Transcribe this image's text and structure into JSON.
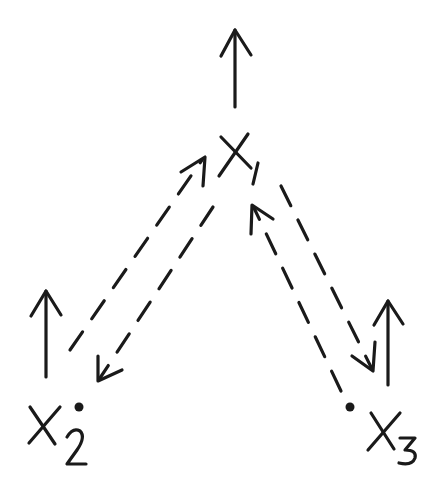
{
  "diagram": {
    "type": "hand-drawn vector diagram",
    "nodes": [
      {
        "id": "x1",
        "label": "X",
        "subscript": "1",
        "label_text": "X1"
      },
      {
        "id": "x2",
        "label": "X",
        "subscript": "2",
        "label_text": "X2"
      },
      {
        "id": "x3",
        "label": "X",
        "subscript": "3",
        "label_text": "X3"
      }
    ],
    "edges": [
      {
        "from": "x2",
        "to": "x1",
        "style": "dashed",
        "arrow": "toward x1"
      },
      {
        "from": "x1",
        "to": "x2",
        "style": "dashed",
        "arrow": "toward x2"
      },
      {
        "from": "x3",
        "to": "x1",
        "style": "dashed",
        "arrow": "toward x1"
      },
      {
        "from": "x1",
        "to": "x3",
        "style": "dashed",
        "arrow": "toward x3"
      }
    ],
    "upward_arrows": [
      {
        "at": "x1",
        "style": "solid"
      },
      {
        "at": "x2",
        "style": "solid"
      },
      {
        "at": "x3",
        "style": "solid"
      }
    ],
    "colors": {
      "ink": "#1a1a1a",
      "background": "#ffffff"
    }
  }
}
